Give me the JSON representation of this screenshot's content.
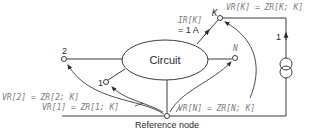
{
  "diagram": {
    "circuit_label": "Circuit",
    "reference_node_label": "Reference node",
    "nodes": {
      "node_2": "2",
      "node_1": "1",
      "node_n": "N",
      "node_k": "K"
    },
    "current_label_line1": "IR[K]",
    "current_label_line2": "= 1 A",
    "source_current_label": "1",
    "equations": {
      "vr_k": "VR[K] = ZR[K; K]",
      "vr_2": "VR[2] = ZR[2; K]",
      "vr_1": "VR[1] = ZR[1; K]",
      "vr_n": "VR[N] = ZR[N; K]"
    },
    "colors": {
      "line": "#3a3a3a",
      "text": "#2a2a2a",
      "equation_text": "#7a7a7a"
    }
  }
}
